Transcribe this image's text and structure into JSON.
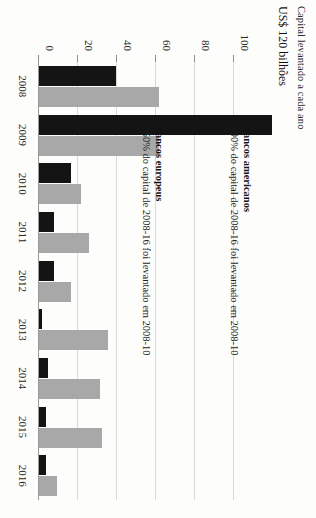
{
  "header": {
    "line1": "Capital levantado a cada ano",
    "line2": "US$ 120 bilhões"
  },
  "annotations": {
    "us": {
      "title": "Bancos americanos",
      "subtitle": "~90% do capital de 2008-16 foi levantado em 2008-10"
    },
    "eu": {
      "title": "Bancos europeus",
      "subtitle": "~50% do capital de 2008-16 foi levantado em 2008-10"
    }
  },
  "colors": {
    "us_series": "#141414",
    "eu_series": "#a8a8a8",
    "axis": "#9a9a97",
    "grid": "#d9d9d6",
    "background": "#fdfdfc",
    "text": "#1a1a1a"
  },
  "chart_data": {
    "type": "bar",
    "title": "Capital levantado a cada ano",
    "subtitle": "US$ 120 bilhões",
    "xlabel": "",
    "ylabel": "US$ 120 bilhões",
    "ylim": [
      0,
      120
    ],
    "yticks": [
      100,
      80,
      60,
      40,
      20,
      0
    ],
    "grid": true,
    "legend": "annotations-inline",
    "orientation": "rotated-90-clockwise",
    "categories": [
      "2008",
      "2009",
      "2010",
      "2011",
      "2012",
      "2013",
      "2014",
      "2015",
      "2016"
    ],
    "series": [
      {
        "name": "Bancos americanos",
        "color": "#141414",
        "values": [
          40,
          120,
          17,
          8,
          8,
          2,
          5,
          4,
          4
        ]
      },
      {
        "name": "Bancos europeus",
        "color": "#a8a8a8",
        "values": [
          62,
          62,
          22,
          26,
          17,
          36,
          32,
          33,
          10
        ]
      }
    ]
  }
}
